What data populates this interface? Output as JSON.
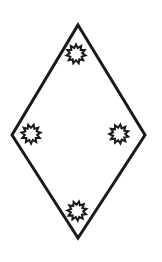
{
  "canvas": {
    "width": 162,
    "height": 262,
    "background_color": "#ffffff",
    "title": "Rhombus with four sun symbols"
  },
  "figure": {
    "name": "rhombus-with-sun-symbols",
    "stroke_color": "#1a1a1a",
    "fill_color": "none",
    "stroke_width": 3,
    "shape_type": "rhombus",
    "vertices": [
      {
        "label": "top",
        "x": 78,
        "y": 25
      },
      {
        "label": "right",
        "x": 145,
        "y": 135
      },
      {
        "label": "bottom",
        "x": 78,
        "y": 238
      },
      {
        "label": "left",
        "x": 12,
        "y": 135
      }
    ],
    "points_path": "78,25 145,135 78,238 12,135"
  },
  "symbols": {
    "type": "sun-burst",
    "count": 4,
    "teeth": 11,
    "stroke_color": "#1a1a1a",
    "fill_color": "#ffffff",
    "stroke_width": 2,
    "inner_radius": 6.2,
    "outer_radius": 9.6,
    "items": [
      {
        "name": "sun-symbol-top",
        "position_label": "top",
        "cx": 76,
        "cy": 54,
        "rotation": 0
      },
      {
        "name": "sun-symbol-left",
        "position_label": "left",
        "cx": 31,
        "cy": 134,
        "rotation": 16
      },
      {
        "name": "sun-symbol-right",
        "position_label": "right",
        "cx": 119,
        "cy": 134,
        "rotation": 8
      },
      {
        "name": "sun-symbol-bottom",
        "position_label": "bottom",
        "cx": 77,
        "cy": 211,
        "rotation": 12
      }
    ]
  }
}
